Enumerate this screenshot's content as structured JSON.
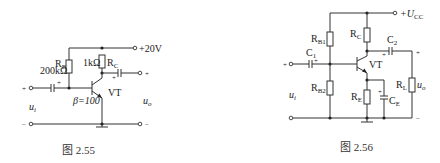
{
  "figures": [
    {
      "id": "fig-2-55",
      "caption": "图 2.55",
      "supply": "+20V",
      "rb_label": "R",
      "rb_sub": "B",
      "rb_value": "200kΩ",
      "rc_value": "1kΩ",
      "rc_label": "R",
      "rc_sub": "C",
      "transistor": "VT",
      "beta": "β=100",
      "input_plus": "+",
      "input_minus": "−",
      "output_plus": "+",
      "output_minus": "−",
      "ui": "u",
      "ui_sub": "i",
      "uo": "u",
      "uo_sub": "o",
      "cap_plus": "+"
    },
    {
      "id": "fig-2-56",
      "caption": "图 2.56",
      "supply": "+U",
      "supply_sub": "CC",
      "rb1_label": "R",
      "rb1_sub": "B1",
      "rb2_label": "R",
      "rb2_sub": "B2",
      "rc_label": "R",
      "rc_sub": "C",
      "re_label": "R",
      "re_sub": "E",
      "rl_label": "R",
      "rl_sub": "L",
      "c1_label": "C",
      "c1_sub": "1",
      "c2_label": "C",
      "c2_sub": "2",
      "ce_label": "C",
      "ce_sub": "E",
      "transistor": "VT",
      "input_plus": "+",
      "ui": "u",
      "ui_sub": "i",
      "uo": "u",
      "uo_sub": "o",
      "output_plus": "+",
      "output_minus": "−",
      "cap_plus": "+"
    }
  ]
}
